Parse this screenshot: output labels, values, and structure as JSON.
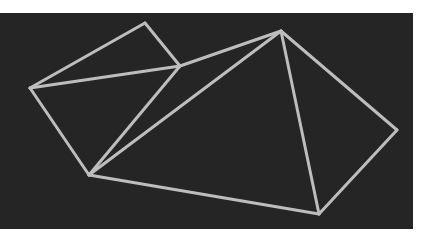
{
  "figure": {
    "background": "#252525",
    "stroke_color": "#bdbdbd",
    "stroke_width": 3,
    "vertices": {
      "A": [
        145,
        23
      ],
      "B": [
        30,
        88
      ],
      "C": [
        180,
        66
      ],
      "D": [
        281,
        31
      ],
      "E": [
        89,
        175
      ],
      "F": [
        397,
        130
      ],
      "G": [
        319,
        214
      ]
    },
    "edges": [
      [
        "A",
        "B"
      ],
      [
        "A",
        "C"
      ],
      [
        "B",
        "C"
      ],
      [
        "C",
        "D"
      ],
      [
        "B",
        "E"
      ],
      [
        "C",
        "E"
      ],
      [
        "D",
        "E"
      ],
      [
        "D",
        "F"
      ],
      [
        "D",
        "G"
      ],
      [
        "F",
        "G"
      ],
      [
        "E",
        "G"
      ]
    ]
  }
}
